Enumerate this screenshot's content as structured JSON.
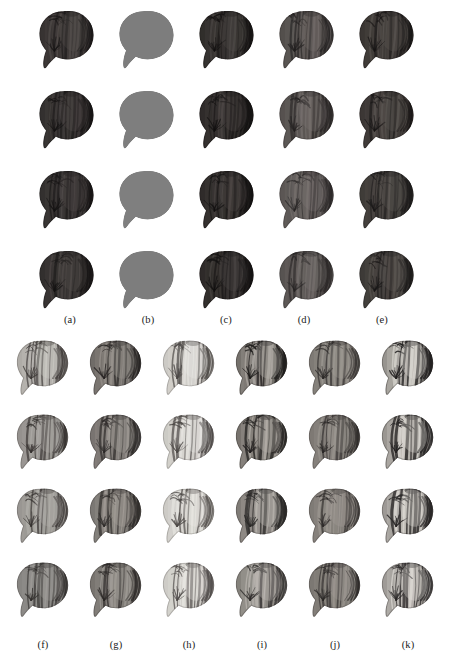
{
  "figure": {
    "type": "image-grid-figure",
    "background_color": "#ffffff",
    "width": 450,
    "height": 658,
    "panels": [
      {
        "id": "top",
        "rows": 4,
        "cols": 5,
        "x": 30,
        "y": 2,
        "cell_width": 80,
        "cell_height": 80,
        "image_width": 74,
        "image_height": 74,
        "label_y": 314,
        "labels": [
          "(a)",
          "(b)",
          "(c)",
          "(d)",
          "(e)"
        ],
        "label_x": [
          70,
          148,
          226,
          304,
          382
        ],
        "columns": [
          {
            "label": "(a)",
            "style": "textured-dark",
            "base_gray": "#2f2c2b",
            "light_gray": "#4b4644",
            "dark_gray": "#151313",
            "highlight_gray": "#5d5755",
            "contrast": 0.45,
            "brightness": 0.22,
            "silhouette_only": false,
            "rows_brightness": [
              0.24,
              0.22,
              0.22,
              0.2
            ]
          },
          {
            "label": "(b)",
            "style": "flat-silhouette",
            "base_gray": "#7d7d7d",
            "light_gray": "#848484",
            "dark_gray": "#767676",
            "highlight_gray": "#8a8a8a",
            "contrast": 0.04,
            "brightness": 0.49,
            "silhouette_only": true,
            "rows_brightness": [
              0.49,
              0.5,
              0.51,
              0.49
            ]
          },
          {
            "label": "(c)",
            "style": "textured-dark",
            "base_gray": "#2b2826",
            "light_gray": "#474240",
            "dark_gray": "#121010",
            "highlight_gray": "#585250",
            "contrast": 0.46,
            "brightness": 0.2,
            "silhouette_only": false,
            "rows_brightness": [
              0.21,
              0.2,
              0.2,
              0.18
            ]
          },
          {
            "label": "(d)",
            "style": "textured-medium",
            "base_gray": "#4e4a48",
            "light_gray": "#6d6764",
            "dark_gray": "#232020",
            "highlight_gray": "#7e7774",
            "contrast": 0.52,
            "brightness": 0.33,
            "silhouette_only": false,
            "rows_brightness": [
              0.33,
              0.35,
              0.38,
              0.36
            ]
          },
          {
            "label": "(e)",
            "style": "textured-dark",
            "base_gray": "#36322f",
            "light_gray": "#534d4a",
            "dark_gray": "#161414",
            "highlight_gray": "#65605c",
            "contrast": 0.48,
            "brightness": 0.24,
            "silhouette_only": false,
            "rows_brightness": [
              0.24,
              0.25,
              0.27,
              0.26
            ]
          }
        ]
      },
      {
        "id": "bottom",
        "rows": 4,
        "cols": 6,
        "x": 8,
        "y": 332,
        "cell_width": 73,
        "cell_height": 74,
        "image_width": 70,
        "image_height": 70,
        "label_y": 639,
        "labels": [
          "(f)",
          "(g)",
          "(h)",
          "(i)",
          "(j)",
          "(k)"
        ],
        "label_x": [
          43,
          116,
          189,
          262,
          335,
          408
        ],
        "columns": [
          {
            "label": "(f)",
            "style": "textured-light",
            "base_gray": "#a9a6a2",
            "light_gray": "#c2bfba",
            "dark_gray": "#3a3634",
            "highlight_gray": "#d2cfca",
            "contrast": 0.66,
            "brightness": 0.66,
            "silhouette_only": false,
            "rows_brightness": [
              0.68,
              0.5,
              0.53,
              0.42
            ]
          },
          {
            "label": "(g)",
            "style": "textured-medium",
            "base_gray": "#6e6a66",
            "light_gray": "#938e89",
            "dark_gray": "#272423",
            "highlight_gray": "#a7a29c",
            "contrast": 0.7,
            "brightness": 0.44,
            "silhouette_only": false,
            "rows_brightness": [
              0.4,
              0.48,
              0.5,
              0.47
            ]
          },
          {
            "label": "(h)",
            "style": "textured-bright",
            "base_gray": "#c9c6c1",
            "light_gray": "#dedbd6",
            "dark_gray": "#4a4644",
            "highlight_gray": "#ecebe7",
            "contrast": 0.72,
            "brightness": 0.79,
            "silhouette_only": false,
            "rows_brightness": [
              0.79,
              0.8,
              0.82,
              0.84
            ]
          },
          {
            "label": "(i)",
            "style": "textured-striped",
            "base_gray": "#6c6863",
            "light_gray": "#9f9a94",
            "dark_gray": "#1f1d1c",
            "highlight_gray": "#bcb7b1",
            "contrast": 0.8,
            "brightness": 0.43,
            "silhouette_only": false,
            "rows_brightness": [
              0.43,
              0.45,
              0.52,
              0.56
            ]
          },
          {
            "label": "(j)",
            "style": "textured-medium",
            "base_gray": "#7a7671",
            "light_gray": "#97928c",
            "dark_gray": "#2b2827",
            "highlight_gray": "#a8a39d",
            "contrast": 0.6,
            "brightness": 0.48,
            "silhouette_only": false,
            "rows_brightness": [
              0.48,
              0.47,
              0.49,
              0.46
            ]
          },
          {
            "label": "(k)",
            "style": "textured-striped",
            "base_gray": "#8e8a85",
            "light_gray": "#c6c2bc",
            "dark_gray": "#222020",
            "highlight_gray": "#e2dfd9",
            "contrast": 0.86,
            "brightness": 0.56,
            "silhouette_only": false,
            "rows_brightness": [
              0.56,
              0.58,
              0.62,
              0.64
            ]
          }
        ]
      }
    ]
  }
}
